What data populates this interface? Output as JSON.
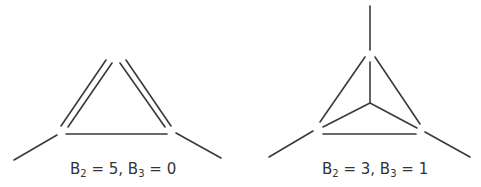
{
  "diagrams": [
    {
      "name": "left-molecule",
      "description": "triangle with two double edges and tails",
      "label": {
        "b2_name": "B",
        "b2_sub": "2",
        "b2_value": " = 5, ",
        "b3_name": "B",
        "b3_sub": "3",
        "b3_value": " = 0"
      }
    },
    {
      "name": "right-molecule",
      "description": "tetrahedral projection with center node and three tails",
      "label": {
        "b2_name": "B",
        "b2_sub": "2",
        "b2_value": " = 3, ",
        "b3_name": "B",
        "b3_sub": "3",
        "b3_value": " = 1"
      }
    }
  ],
  "colors": {
    "line": "#3a3a3a",
    "text": "#333333",
    "background": "#ffffff"
  }
}
